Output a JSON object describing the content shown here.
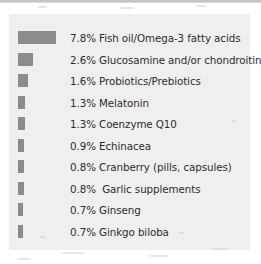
{
  "chart_data": {
    "type": "bar",
    "orientation": "horizontal",
    "title": "",
    "subtitle": "",
    "xlabel": "",
    "ylabel": "",
    "unit": "%",
    "grid": false,
    "legend": null,
    "axis_visible": false,
    "xlim": [
      0,
      7.8
    ],
    "categories": [
      "Fish oil/Omega-3 fatty acids",
      "Glucosamine and/or chondroitin",
      "Probiotics/Prebiotics",
      "Melatonin",
      "Coenzyme Q10",
      "Echinacea",
      "Cranberry (pills, capsules)",
      "Garlic supplements",
      "Ginseng",
      "Ginkgo biloba"
    ],
    "values": [
      7.8,
      2.6,
      1.6,
      1.3,
      1.3,
      0.9,
      0.8,
      0.8,
      0.7,
      0.7
    ],
    "value_labels": [
      "7.8%",
      "2.6%",
      "1.6%",
      "1.3%",
      "1.3%",
      "0.9%",
      "0.8%",
      "0.8%",
      "0.7%",
      "0.7%"
    ],
    "bar_color": "#8b8b8b",
    "panel_color": "#f0efef",
    "text_color": "#2c2c2c"
  },
  "rows": [
    {
      "pct": "7.8%",
      "name": "Fish oil/Omega-3 fatty acids",
      "text": "7.8% Fish oil/Omega-3 fatty acids",
      "bar_px": 38
    },
    {
      "pct": "2.6%",
      "name": "Glucosamine and/or chondroitin",
      "text": "2.6% Glucosamine and/or chondroitin",
      "bar_px": 15
    },
    {
      "pct": "1.6%",
      "name": "Probiotics/Prebiotics",
      "text": "1.6% Probiotics/Prebiotics",
      "bar_px": 10
    },
    {
      "pct": "1.3%",
      "name": "Melatonin",
      "text": "1.3% Melatonin",
      "bar_px": 7
    },
    {
      "pct": "1.3%",
      "name": "Coenzyme Q10",
      "text": "1.3% Coenzyme Q10",
      "bar_px": 7
    },
    {
      "pct": "0.9%",
      "name": "Echinacea",
      "text": "0.9% Echinacea",
      "bar_px": 6
    },
    {
      "pct": "0.8%",
      "name": "Cranberry (pills, capsules)",
      "text": "0.8% Cranberry (pills, capsules)",
      "bar_px": 6
    },
    {
      "pct": "0.8%",
      "name": "Garlic supplements",
      "text": "0.8%  Garlic supplements",
      "bar_px": 6
    },
    {
      "pct": "0.7%",
      "name": "Ginseng",
      "text": "0.7% Ginseng",
      "bar_px": 5
    },
    {
      "pct": "0.7%",
      "name": "Ginkgo biloba",
      "text": "0.7% Ginkgo biloba",
      "bar_px": 5
    }
  ]
}
